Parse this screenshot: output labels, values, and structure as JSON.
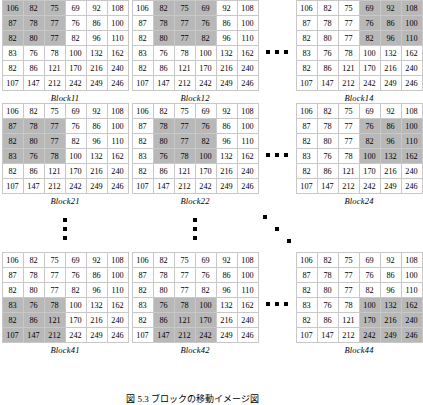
{
  "figure": {
    "caption": "図 5.3 ブロックの移動イメージ図",
    "matrix_rows": 6,
    "matrix_cols": 6,
    "window_size": 3,
    "highlight_color": "#b8b8b8",
    "cell_border_color": "#c8c8c8",
    "text_color": "#000000",
    "background_color": "#ffffff"
  },
  "matrix_values": [
    [
      106,
      82,
      75,
      69,
      92,
      108
    ],
    [
      87,
      78,
      77,
      76,
      86,
      100
    ],
    [
      82,
      80,
      77,
      82,
      96,
      110
    ],
    [
      83,
      76,
      78,
      100,
      132,
      162
    ],
    [
      82,
      86,
      121,
      170,
      216,
      240
    ],
    [
      107,
      147,
      212,
      242,
      249,
      246
    ]
  ],
  "blocks": [
    {
      "label": "Block11",
      "row_start": 0,
      "col_start": 0,
      "grid_position": "top-left"
    },
    {
      "label": "Block12",
      "row_start": 0,
      "col_start": 1,
      "grid_position": "top-center"
    },
    {
      "label": "Block14",
      "row_start": 0,
      "col_start": 3,
      "grid_position": "top-right"
    },
    {
      "label": "Block21",
      "row_start": 1,
      "col_start": 0,
      "grid_position": "middle-left"
    },
    {
      "label": "Block22",
      "row_start": 1,
      "col_start": 1,
      "grid_position": "middle-center"
    },
    {
      "label": "Block24",
      "row_start": 1,
      "col_start": 3,
      "grid_position": "middle-right"
    },
    {
      "label": "Block41",
      "row_start": 3,
      "col_start": 0,
      "grid_position": "bottom-left"
    },
    {
      "label": "Block42",
      "row_start": 3,
      "col_start": 1,
      "grid_position": "bottom-center"
    },
    {
      "label": "Block44",
      "row_start": 3,
      "col_start": 3,
      "grid_position": "bottom-right"
    }
  ],
  "ellipses": [
    {
      "name": "horizontal-ellipsis-row1",
      "glyph": "...",
      "orientation": "horizontal"
    },
    {
      "name": "horizontal-ellipsis-row2",
      "glyph": "...",
      "orientation": "horizontal"
    },
    {
      "name": "horizontal-ellipsis-row3",
      "glyph": "...",
      "orientation": "horizontal"
    },
    {
      "name": "vertical-ellipsis-col1",
      "glyph": "⋮",
      "orientation": "vertical"
    },
    {
      "name": "vertical-ellipsis-col2",
      "glyph": "⋮",
      "orientation": "vertical"
    },
    {
      "name": "diagonal-ellipsis",
      "glyph": "⋱",
      "orientation": "diagonal"
    }
  ]
}
